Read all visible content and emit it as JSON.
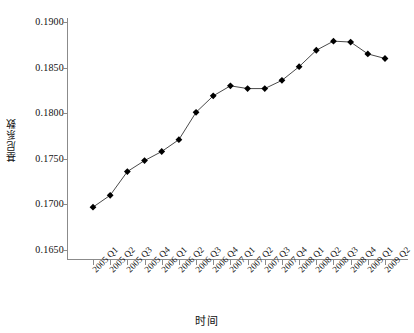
{
  "chart_data": {
    "type": "line",
    "title": "",
    "xlabel": "时间",
    "ylabel": "基尼系数",
    "categories": [
      "2005 Q1",
      "2005 Q2",
      "2005 Q3",
      "2005 Q4",
      "2006 Q1",
      "2006 Q2",
      "2006 Q3",
      "2006 Q4",
      "2007 Q1",
      "2007 Q2",
      "2007 Q3",
      "2007 Q4",
      "2008 Q1",
      "2008 Q2",
      "2008 Q3",
      "2008 Q4",
      "2009 Q1",
      "2009 Q2"
    ],
    "values": [
      0.1697,
      0.171,
      0.1736,
      0.1748,
      0.1758,
      0.1771,
      0.1801,
      0.1819,
      0.183,
      0.1827,
      0.1827,
      0.1836,
      0.1851,
      0.1869,
      0.1879,
      0.1878,
      0.1865,
      0.186
    ],
    "ylim": [
      0.165,
      0.19
    ],
    "ytick_values": [
      0.19,
      0.185,
      0.18,
      0.175,
      0.17,
      0.165
    ],
    "ytick_labels": [
      "0.1900",
      "0.1850",
      "0.1800",
      "0.1750",
      "0.1700",
      "0.1650"
    ],
    "grid": false,
    "legend": null,
    "series_name": "基尼系数",
    "marker": "diamond",
    "line_color": "#4a4a4a",
    "marker_color": "#000000",
    "axis_color": "#8b8b8b",
    "background_color": "#ffffff"
  }
}
